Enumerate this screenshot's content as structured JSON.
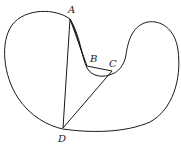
{
  "diagram": {
    "type": "geometry",
    "colors": {
      "stroke": "#1a1a1a",
      "background": "#ffffff"
    },
    "points": [
      {
        "id": "A",
        "label": "A",
        "x": 70,
        "y": 19,
        "label_x": 68,
        "label_y": 13
      },
      {
        "id": "B",
        "label": "B",
        "x": 87,
        "y": 66,
        "label_x": 91,
        "label_y": 62
      },
      {
        "id": "C",
        "label": "C",
        "x": 112,
        "y": 71,
        "label_x": 110,
        "label_y": 67
      },
      {
        "id": "D",
        "label": "D",
        "x": 63,
        "y": 128,
        "label_x": 59,
        "label_y": 141
      }
    ],
    "segments": [
      "AB",
      "BC",
      "CD",
      "DA"
    ]
  }
}
